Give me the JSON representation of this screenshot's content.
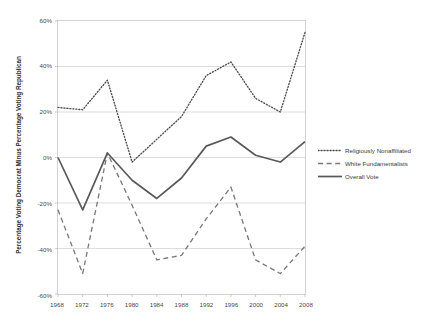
{
  "chart_data": {
    "type": "line",
    "title": "",
    "xlabel": "",
    "ylabel": "Percentage Voting Democrat Minus Percentage Voting Republican",
    "x": [
      1968,
      1972,
      1976,
      1980,
      1984,
      1988,
      1992,
      1996,
      2000,
      2004,
      2008
    ],
    "xtick_labels": [
      "1968",
      "1972",
      "1976",
      "1980",
      "1984",
      "1988",
      "1992",
      "1996",
      "2000",
      "2004",
      "2008"
    ],
    "ytick_labels": [
      "60%",
      "40%",
      "20%",
      "0%",
      "-20%",
      "-40%",
      "-60%"
    ],
    "ytick_values": [
      60,
      40,
      20,
      0,
      -20,
      -40,
      -60
    ],
    "ylim": [
      -60,
      60
    ],
    "xlim": [
      1968,
      2008
    ],
    "grid": "horizontal",
    "legend_position": "right",
    "series": [
      {
        "name": "Religiously Nonaffiliated",
        "style": "dotted",
        "color": "#4d4d4d",
        "values": [
          22,
          21,
          34,
          -2,
          8,
          18,
          36,
          42,
          26,
          20,
          55
        ]
      },
      {
        "name": "White Fundamentalists",
        "style": "dashed",
        "color": "#7a7a7a",
        "values": [
          -23,
          -51,
          2,
          -21,
          -45,
          -43,
          -27,
          -13,
          -45,
          -51,
          -39
        ]
      },
      {
        "name": "Overall Vote",
        "style": "solid",
        "color": "#595959",
        "values": [
          0,
          -23,
          2,
          -10,
          -18,
          -9,
          5,
          9,
          1,
          -2,
          7
        ]
      }
    ]
  },
  "legend": {
    "items": [
      {
        "label": "Religiously Nonaffiliated"
      },
      {
        "label": "White Fundamentalists"
      },
      {
        "label": "Overall Vote"
      }
    ]
  }
}
